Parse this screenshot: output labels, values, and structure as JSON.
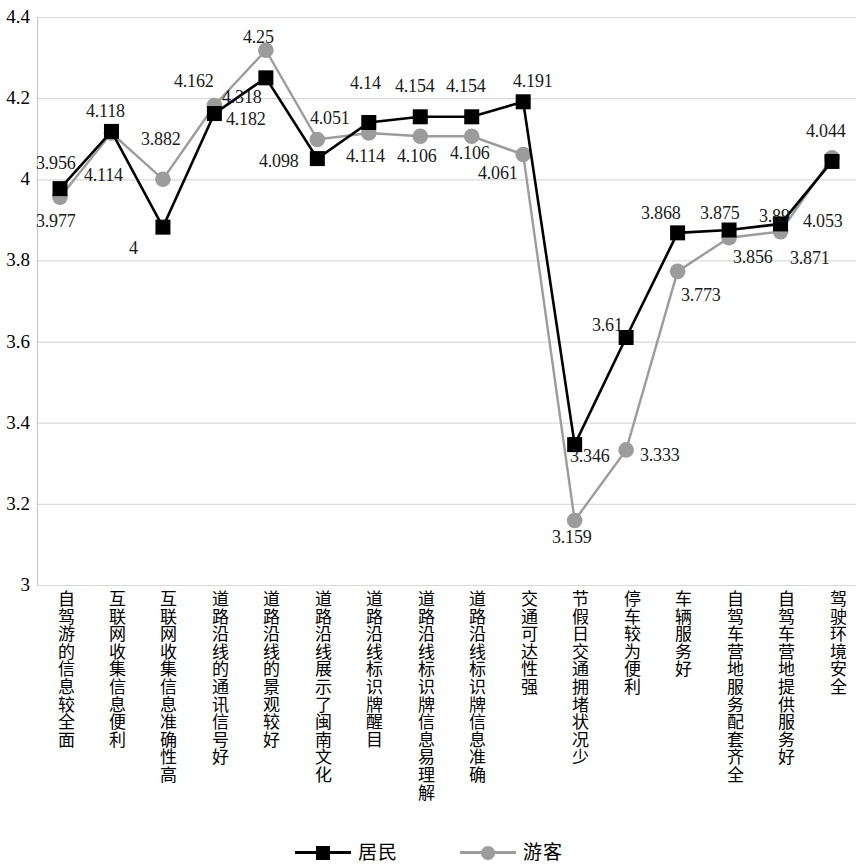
{
  "chart_data": {
    "type": "line",
    "title": "",
    "xlabel": "",
    "ylabel": "",
    "ylim": [
      3,
      4.4
    ],
    "yticks": [
      "3",
      "3.2",
      "3.4",
      "3.6",
      "3.8",
      "4",
      "4.2",
      "4.4"
    ],
    "grid": true,
    "legend_position": "bottom",
    "categories": [
      "自驾游的信息较全面",
      "互联网收集信息便利",
      "互联网收集信息准确性高",
      "道路沿线的通讯信号好",
      "道路沿线的景观较好",
      "道路沿线展示了闽南文化",
      "道路沿线标识牌醒目",
      "道路沿线标识牌信息易理解",
      "道路沿线标识牌信息准确",
      "交通可达性强",
      "节假日交通拥堵状况少",
      "停车较为便利",
      "车辆服务好",
      "自驾车营地服务配套齐全",
      "自驾车营地提供服务好",
      "驾驶环境安全"
    ],
    "series": [
      {
        "name": "居民",
        "color": "#000000",
        "marker": "square",
        "values": [
          3.977,
          4.118,
          3.882,
          4.162,
          4.25,
          4.051,
          4.14,
          4.154,
          4.154,
          4.191,
          3.346,
          3.61,
          3.868,
          3.875,
          3.89,
          4.044
        ]
      },
      {
        "name": "游客",
        "color": "#9c9c9c",
        "marker": "circle",
        "values": [
          3.956,
          4.114,
          4.0,
          4.182,
          4.318,
          4.098,
          4.114,
          4.106,
          4.106,
          4.061,
          3.159,
          3.333,
          3.773,
          3.856,
          3.871,
          4.053
        ]
      }
    ]
  },
  "value_labels": [
    {
      "text": "3.977",
      "x": 36,
      "y": 212,
      "series": 0
    },
    {
      "text": "4.118",
      "x": 86,
      "y": 102,
      "series": 0
    },
    {
      "text": "4",
      "x": 129,
      "y": 239,
      "series": 0
    },
    {
      "text": "4.162",
      "x": 174,
      "y": 72,
      "series": 0
    },
    {
      "text": "4.25",
      "x": 243,
      "y": 28,
      "series": 0
    },
    {
      "text": "4.098",
      "x": 259,
      "y": 152,
      "series": 0
    },
    {
      "text": "4.14",
      "x": 350,
      "y": 74,
      "series": 0
    },
    {
      "text": "4.154",
      "x": 395,
      "y": 77,
      "series": 0
    },
    {
      "text": "4.154",
      "x": 446,
      "y": 77,
      "series": 0
    },
    {
      "text": "4.191",
      "x": 513,
      "y": 72,
      "series": 0
    },
    {
      "text": "3.346",
      "x": 570,
      "y": 447,
      "series": 0
    },
    {
      "text": "3.61",
      "x": 592,
      "y": 316,
      "series": 0
    },
    {
      "text": "3.868",
      "x": 641,
      "y": 204,
      "series": 0
    },
    {
      "text": "3.875",
      "x": 700,
      "y": 204,
      "series": 0
    },
    {
      "text": "3.89",
      "x": 759,
      "y": 207,
      "series": 0
    },
    {
      "text": "4.053",
      "x": 803,
      "y": 212,
      "series": 0
    },
    {
      "text": "3.956",
      "x": 36,
      "y": 154,
      "series": 1
    },
    {
      "text": "4.114",
      "x": 84,
      "y": 166,
      "series": 1
    },
    {
      "text": "3.882",
      "x": 141,
      "y": 130,
      "series": 1
    },
    {
      "text": "4.318",
      "x": 222,
      "y": 88,
      "series": 1
    },
    {
      "text": "4.182",
      "x": 226,
      "y": 110,
      "series": 1
    },
    {
      "text": "4.051",
      "x": 310,
      "y": 109,
      "series": 1
    },
    {
      "text": "4.114",
      "x": 346,
      "y": 147,
      "series": 1
    },
    {
      "text": "4.106",
      "x": 397,
      "y": 147,
      "series": 1
    },
    {
      "text": "4.106",
      "x": 450,
      "y": 144,
      "series": 1
    },
    {
      "text": "4.061",
      "x": 478,
      "y": 164,
      "series": 1
    },
    {
      "text": "3.159",
      "x": 552,
      "y": 528,
      "series": 1
    },
    {
      "text": "3.333",
      "x": 640,
      "y": 446,
      "series": 1
    },
    {
      "text": "3.773",
      "x": 681,
      "y": 286,
      "series": 1
    },
    {
      "text": "3.856",
      "x": 733,
      "y": 248,
      "series": 1
    },
    {
      "text": "3.871",
      "x": 790,
      "y": 249,
      "series": 1
    },
    {
      "text": "4.044",
      "x": 806,
      "y": 122,
      "series": 1
    }
  ],
  "legend": {
    "items": [
      {
        "label": "居民",
        "color": "#000000",
        "marker": "square"
      },
      {
        "label": "游客",
        "color": "#9c9c9c",
        "marker": "circle"
      }
    ]
  },
  "colors": {
    "residents": "#000000",
    "tourists": "#9c9c9c",
    "grid": "#d9d9d9",
    "background": "#ffffff"
  }
}
